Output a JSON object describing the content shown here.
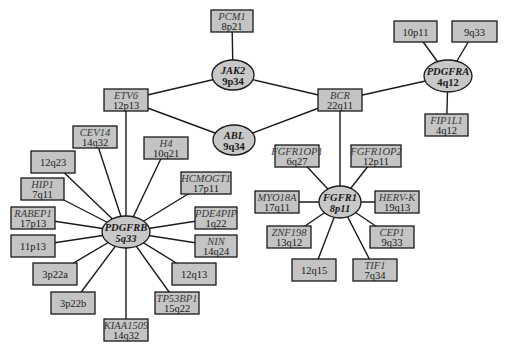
{
  "diagram": {
    "title": "",
    "hubs": [
      {
        "id": "JAK2",
        "gene": "JAK2",
        "locus": "9p34",
        "cx": 233,
        "cy": 75,
        "rx": 21,
        "ry": 15,
        "locus_italic": false
      },
      {
        "id": "ABL",
        "gene": "ABL",
        "locus": "9q34",
        "cx": 234,
        "cy": 140,
        "rx": 21,
        "ry": 15,
        "locus_italic": false
      },
      {
        "id": "PDGFRA",
        "gene": "PDGFRA",
        "locus": "4q12",
        "cx": 448,
        "cy": 76,
        "rx": 24,
        "ry": 16,
        "locus_italic": false
      },
      {
        "id": "PDGFRB",
        "gene": "PDGFRB",
        "locus": "5q33",
        "cx": 126,
        "cy": 232,
        "rx": 24,
        "ry": 16,
        "locus_italic": true
      },
      {
        "id": "FGFR1",
        "gene": "FGFR1",
        "locus": "8p11",
        "cx": 340,
        "cy": 202,
        "rx": 21,
        "ry": 16,
        "locus_italic": true
      }
    ],
    "boxes": [
      {
        "id": "PCM1",
        "gene": "PCM1",
        "locus": "8p21",
        "x": 211,
        "y": 10,
        "w": 42,
        "h": 22
      },
      {
        "id": "ETV6",
        "gene": "ETV6",
        "locus": "12p13",
        "x": 104,
        "y": 89,
        "w": 44,
        "h": 22
      },
      {
        "id": "BCR",
        "gene": "BCR",
        "locus": "22q11",
        "x": 318,
        "y": 89,
        "w": 44,
        "h": 22
      },
      {
        "id": "10p11",
        "gene": "",
        "locus": "10p11",
        "x": 394,
        "y": 21,
        "w": 43,
        "h": 21
      },
      {
        "id": "9q33a",
        "gene": "",
        "locus": "9q33",
        "x": 452,
        "y": 21,
        "w": 45,
        "h": 21
      },
      {
        "id": "FIP1L1",
        "gene": "FIP1L1",
        "locus": "4q12",
        "x": 425,
        "y": 114,
        "w": 43,
        "h": 22
      },
      {
        "id": "CEV14",
        "gene": "CEV14",
        "locus": "14q32",
        "x": 73,
        "y": 126,
        "w": 44,
        "h": 22
      },
      {
        "id": "H4",
        "gene": "H4",
        "locus": "10q21",
        "x": 144,
        "y": 137,
        "w": 44,
        "h": 22
      },
      {
        "id": "12q23",
        "gene": "",
        "locus": "12q23",
        "x": 31,
        "y": 151,
        "w": 44,
        "h": 22
      },
      {
        "id": "HCMOGT1",
        "gene": "HCMOGT1",
        "locus": "17p11",
        "x": 181,
        "y": 172,
        "w": 50,
        "h": 22
      },
      {
        "id": "HIP1",
        "gene": "HIP1",
        "locus": "7q11",
        "x": 21,
        "y": 178,
        "w": 43,
        "h": 22
      },
      {
        "id": "RABEP1",
        "gene": "RABEP1",
        "locus": "17p13",
        "x": 11,
        "y": 207,
        "w": 44,
        "h": 22
      },
      {
        "id": "PDE4PIP",
        "gene": "PDE4PIP",
        "locus": "1q22",
        "x": 195,
        "y": 207,
        "w": 42,
        "h": 22
      },
      {
        "id": "11p13",
        "gene": "",
        "locus": "11p13",
        "x": 11,
        "y": 235,
        "w": 44,
        "h": 22
      },
      {
        "id": "NIN",
        "gene": "NIN",
        "locus": "14q24",
        "x": 195,
        "y": 235,
        "w": 42,
        "h": 22
      },
      {
        "id": "3p22a",
        "gene": "",
        "locus": "3p22a",
        "x": 33,
        "y": 263,
        "w": 44,
        "h": 22
      },
      {
        "id": "12q13",
        "gene": "",
        "locus": "12q13",
        "x": 172,
        "y": 263,
        "w": 44,
        "h": 22
      },
      {
        "id": "3p22b",
        "gene": "",
        "locus": "3p22b",
        "x": 51,
        "y": 292,
        "w": 44,
        "h": 22
      },
      {
        "id": "TP53BP1",
        "gene": "TP53BP1",
        "locus": "15q22",
        "x": 155,
        "y": 292,
        "w": 44,
        "h": 22
      },
      {
        "id": "KIAA1509",
        "gene": "KIAA1509",
        "locus": "14q32",
        "x": 104,
        "y": 319,
        "w": 44,
        "h": 22
      },
      {
        "id": "FGFR1OP1",
        "gene": "FGFR1OP1",
        "locus": "6q27",
        "x": 275,
        "y": 145,
        "w": 44,
        "h": 22
      },
      {
        "id": "FGFR1OP2",
        "gene": "FGFR1OP2",
        "locus": "12p11",
        "x": 351,
        "y": 145,
        "w": 50,
        "h": 22
      },
      {
        "id": "MYO18A",
        "gene": "MYO18A",
        "locus": "17q11",
        "x": 255,
        "y": 191,
        "w": 44,
        "h": 22
      },
      {
        "id": "HERV-K",
        "gene": "HERV-K",
        "locus": "19q13",
        "x": 375,
        "y": 191,
        "w": 44,
        "h": 22
      },
      {
        "id": "ZNF198",
        "gene": "ZNF198",
        "locus": "13q12",
        "x": 267,
        "y": 226,
        "w": 44,
        "h": 22
      },
      {
        "id": "CEP1",
        "gene": "CEP1",
        "locus": "9q33",
        "x": 370,
        "y": 226,
        "w": 44,
        "h": 22
      },
      {
        "id": "12q15",
        "gene": "",
        "locus": "12q15",
        "x": 292,
        "y": 259,
        "w": 44,
        "h": 22
      },
      {
        "id": "TIF1",
        "gene": "TIF1",
        "locus": "7q34",
        "x": 353,
        "y": 259,
        "w": 44,
        "h": 22
      }
    ],
    "edges": [
      [
        "PCM1",
        "JAK2"
      ],
      [
        "ETV6",
        "JAK2"
      ],
      [
        "ETV6",
        "ABL"
      ],
      [
        "JAK2",
        "BCR"
      ],
      [
        "ABL",
        "BCR"
      ],
      [
        "BCR",
        "PDGFRA"
      ],
      [
        "10p11",
        "PDGFRA"
      ],
      [
        "9q33a",
        "PDGFRA"
      ],
      [
        "FIP1L1",
        "PDGFRA"
      ],
      [
        "ETV6",
        "PDGFRB"
      ],
      [
        "CEV14",
        "PDGFRB"
      ],
      [
        "H4",
        "PDGFRB"
      ],
      [
        "12q23",
        "PDGFRB"
      ],
      [
        "HCMOGT1",
        "PDGFRB"
      ],
      [
        "HIP1",
        "PDGFRB"
      ],
      [
        "RABEP1",
        "PDGFRB"
      ],
      [
        "PDE4PIP",
        "PDGFRB"
      ],
      [
        "11p13",
        "PDGFRB"
      ],
      [
        "NIN",
        "PDGFRB"
      ],
      [
        "3p22a",
        "PDGFRB"
      ],
      [
        "12q13",
        "PDGFRB"
      ],
      [
        "3p22b",
        "PDGFRB"
      ],
      [
        "TP53BP1",
        "PDGFRB"
      ],
      [
        "KIAA1509",
        "PDGFRB"
      ],
      [
        "BCR",
        "FGFR1"
      ],
      [
        "FGFR1OP1",
        "FGFR1"
      ],
      [
        "FGFR1OP2",
        "FGFR1"
      ],
      [
        "MYO18A",
        "FGFR1"
      ],
      [
        "HERV-K",
        "FGFR1"
      ],
      [
        "ZNF198",
        "FGFR1"
      ],
      [
        "CEP1",
        "FGFR1"
      ],
      [
        "12q15",
        "FGFR1"
      ],
      [
        "TIF1",
        "FGFR1"
      ]
    ]
  },
  "colors": {
    "node_fill": "#c4c4c4",
    "hub_fill": "#c8c8c8",
    "stroke": "#1a1a1a",
    "background": "#ffffff"
  }
}
